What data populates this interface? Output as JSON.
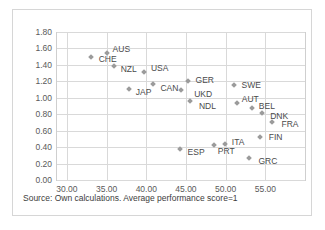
{
  "chart_data": {
    "type": "scatter",
    "title": "",
    "xlabel": "",
    "ylabel": "",
    "xlim": [
      28.75,
      60.0
    ],
    "ylim": [
      0.0,
      1.8
    ],
    "xticks": [
      "30.00",
      "35.00",
      "40.00",
      "45.00",
      "50.00",
      "55.00"
    ],
    "xtick_values": [
      30,
      35,
      40,
      45,
      50,
      55
    ],
    "yticks": [
      "0.00",
      "0.20",
      "0.40",
      "0.60",
      "0.80",
      "1.00",
      "1.20",
      "1.40",
      "1.60",
      "1.80"
    ],
    "ytick_values": [
      0.0,
      0.2,
      0.4,
      0.6,
      0.8,
      1.0,
      1.2,
      1.4,
      1.6,
      1.8
    ],
    "grid": true,
    "legend": "none",
    "marker_color": "#9b9b9b",
    "points": [
      {
        "label": "CHE",
        "x": 33.0,
        "y": 1.5,
        "lx": 8,
        "ly": 2
      },
      {
        "label": "AUS",
        "x": 35.0,
        "y": 1.545,
        "lx": 6,
        "ly": -4
      },
      {
        "label": "NZL",
        "x": 35.9,
        "y": 1.39,
        "lx": 7,
        "ly": 3
      },
      {
        "label": "USA",
        "x": 39.7,
        "y": 1.31,
        "lx": 7,
        "ly": -4
      },
      {
        "label": "JAP",
        "x": 37.8,
        "y": 1.11,
        "lx": 7,
        "ly": 3
      },
      {
        "label": "CAN",
        "x": 40.9,
        "y": 1.17,
        "lx": 7,
        "ly": 4
      },
      {
        "label": "GER",
        "x": 45.2,
        "y": 1.2,
        "lx": 8,
        "ly": -1
      },
      {
        "label": "UKD",
        "x": 44.4,
        "y": 1.09,
        "lx": 13,
        "ly": 4
      },
      {
        "label": "NDL",
        "x": 45.5,
        "y": 0.96,
        "lx": 9,
        "ly": 5
      },
      {
        "label": "SWE",
        "x": 51.0,
        "y": 1.16,
        "lx": 8,
        "ly": 0
      },
      {
        "label": "AUT",
        "x": 51.4,
        "y": 0.94,
        "lx": 5,
        "ly": -4
      },
      {
        "label": "BEL",
        "x": 53.3,
        "y": 0.87,
        "lx": 7,
        "ly": -2
      },
      {
        "label": "DNK",
        "x": 54.6,
        "y": 0.82,
        "lx": 8,
        "ly": 3
      },
      {
        "label": "FRA",
        "x": 55.9,
        "y": 0.71,
        "lx": 9,
        "ly": 2
      },
      {
        "label": "FIN",
        "x": 54.3,
        "y": 0.52,
        "lx": 9,
        "ly": 0
      },
      {
        "label": "ESP",
        "x": 44.2,
        "y": 0.38,
        "lx": 8,
        "ly": 3
      },
      {
        "label": "PRT",
        "x": 48.5,
        "y": 0.42,
        "lx": 4,
        "ly": 6
      },
      {
        "label": "ITA",
        "x": 49.9,
        "y": 0.44,
        "lx": 7,
        "ly": -2
      },
      {
        "label": "GRC",
        "x": 53.0,
        "y": 0.27,
        "lx": 9,
        "ly": 3
      }
    ]
  },
  "footer": {
    "source_note": "Source: Own calculations. Average performance score=1"
  }
}
